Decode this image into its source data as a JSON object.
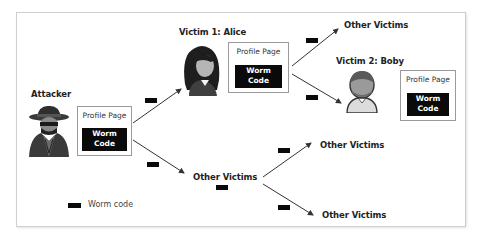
{
  "diagram": {
    "nodes": {
      "attacker": {
        "label": "Attacker",
        "profile_title": "Profile Page",
        "worm_label_line1": "Worm",
        "worm_label_line2": "Code"
      },
      "victim1": {
        "label": "Victim 1: Alice",
        "profile_title": "Profile Page",
        "worm_label_line1": "Worm",
        "worm_label_line2": "Code"
      },
      "victim2": {
        "label": "Victim 2: Boby",
        "profile_title": "Profile Page",
        "worm_label_line1": "Worm",
        "worm_label_line2": "Code"
      },
      "other_from_alice": {
        "label": "Other Victims"
      },
      "other_from_attacker": {
        "label": "Other Victims"
      },
      "other_top_right": {
        "label": "Other Victims"
      },
      "other_bottom_right": {
        "label": "Other Victims"
      }
    },
    "edges": [
      {
        "from": "attacker",
        "to": "victim1",
        "carries": "worm code"
      },
      {
        "from": "attacker",
        "to": "other_from_attacker",
        "carries": "worm code"
      },
      {
        "from": "victim1",
        "to": "other_from_alice",
        "carries": "worm code"
      },
      {
        "from": "victim1",
        "to": "victim2",
        "carries": "worm code"
      },
      {
        "from": "other_from_attacker",
        "to": "other_top_right",
        "carries": "worm code"
      },
      {
        "from": "other_from_attacker",
        "to": "other_bottom_right",
        "carries": "worm code"
      }
    ],
    "legend": {
      "symbol": "black-rectangle",
      "label": "Worm code"
    },
    "colors": {
      "worm_box": "#0a0a0a",
      "worm_text": "#ffffff",
      "frame_border": "#cfcfcf",
      "profile_border": "#9a9a9a",
      "arrow": "#333333"
    }
  }
}
